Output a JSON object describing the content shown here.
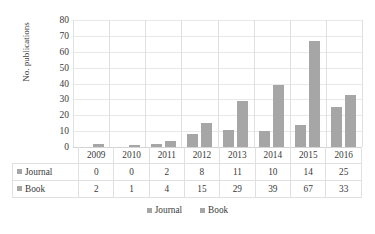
{
  "chart_data": {
    "type": "bar",
    "title": "",
    "xlabel": "",
    "ylabel": "No. publications",
    "categories": [
      "2009",
      "2010",
      "2011",
      "2012",
      "2013",
      "2014",
      "2015",
      "2016"
    ],
    "series": [
      {
        "name": "Journal",
        "values": [
          0,
          0,
          2,
          8,
          11,
          10,
          14,
          25
        ]
      },
      {
        "name": "Book",
        "values": [
          2,
          1,
          4,
          15,
          29,
          39,
          67,
          33
        ]
      }
    ],
    "ylim": [
      0,
      80
    ],
    "yticks": [
      0,
      10,
      20,
      30,
      40,
      50,
      60,
      70,
      80
    ],
    "ytick_labels": [
      "0",
      "10",
      "20",
      "30",
      "40",
      "50",
      "60",
      "70",
      "80"
    ],
    "grid": true,
    "legend_position": "bottom",
    "data_table_visible": true,
    "colors": {
      "journal": "#A6A6A6",
      "book": "#A6A6A6",
      "gridline": "#E8E8E8",
      "axis": "#D4D4D4",
      "text": "#3A3A3A",
      "table_border": "#E0E0E0",
      "background": "#FFFFFF"
    }
  },
  "legend": {
    "items": [
      {
        "label": "Journal",
        "swatch": "legend-swatch-icon"
      },
      {
        "label": "Book",
        "swatch": "legend-swatch-icon"
      }
    ]
  }
}
